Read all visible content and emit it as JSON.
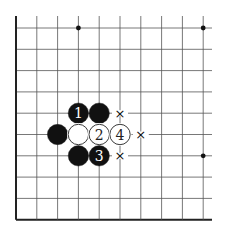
{
  "board": {
    "origin_x": 16,
    "origin_y": 28,
    "spacing_x": 20.8,
    "spacing_y": 21.3,
    "cols": 10,
    "rows": 10,
    "right_extent": 212,
    "line_color": "#555555",
    "edge_color": "#222222",
    "edges": [
      "left",
      "bottom"
    ]
  },
  "star_points": [
    {
      "col": 3,
      "row": 0
    },
    {
      "col": 9,
      "row": 0
    },
    {
      "col": 9,
      "row": 6
    }
  ],
  "stones": [
    {
      "color": "black",
      "col": 3,
      "row": 4,
      "label": "1"
    },
    {
      "color": "black",
      "col": 4,
      "row": 4,
      "label": ""
    },
    {
      "color": "black",
      "col": 2,
      "row": 5,
      "label": ""
    },
    {
      "color": "white",
      "col": 3,
      "row": 5,
      "label": ""
    },
    {
      "color": "white",
      "col": 4,
      "row": 5,
      "label": "2"
    },
    {
      "color": "white",
      "col": 5,
      "row": 5,
      "label": "4"
    },
    {
      "color": "black",
      "col": 3,
      "row": 6,
      "label": ""
    },
    {
      "color": "black",
      "col": 4,
      "row": 6,
      "label": "3"
    }
  ],
  "marks": [
    {
      "symbol": "×",
      "col": 5,
      "row": 4
    },
    {
      "symbol": "×",
      "col": 6,
      "row": 5
    },
    {
      "symbol": "×",
      "col": 5,
      "row": 6
    }
  ]
}
